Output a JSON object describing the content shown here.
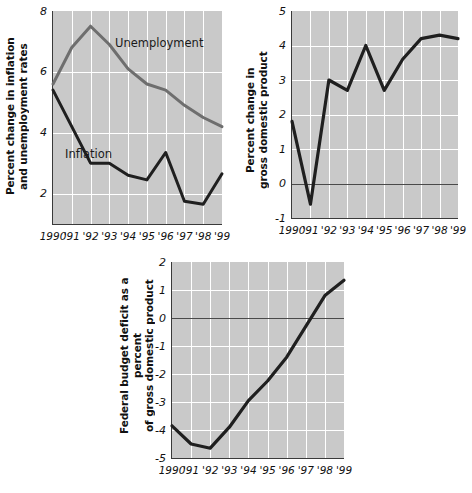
{
  "figure": {
    "panels": [
      "inflation-unemployment",
      "gdp",
      "deficit"
    ]
  },
  "chart_data": [
    {
      "id": "inflation-unemployment",
      "type": "line",
      "title": "",
      "xlabel": "",
      "ylabel": "Percent change in inflation\nand unemployment rates",
      "x": [
        1990,
        1991,
        1992,
        1993,
        1994,
        1995,
        1996,
        1997,
        1998,
        1999
      ],
      "xtick_labels": [
        "1990",
        "'91",
        "'92",
        "'93",
        "'94",
        "'95",
        "'96",
        "'97",
        "'98",
        "'99"
      ],
      "ytick_labels": [
        "8",
        "6",
        "4",
        "2"
      ],
      "yticks": [
        8,
        6,
        4,
        2
      ],
      "ylim": [
        1.0,
        8.0
      ],
      "grid": true,
      "legend": "inline-annotations",
      "series": [
        {
          "name": "Unemployment",
          "color": "#6e6e6e",
          "values": [
            5.6,
            6.8,
            7.5,
            6.9,
            6.1,
            5.6,
            5.4,
            4.9,
            4.5,
            4.2
          ],
          "annotation": "Unemployment"
        },
        {
          "name": "Inflation",
          "color": "#1f1f1f",
          "values": [
            5.4,
            4.2,
            3.0,
            3.0,
            2.6,
            2.45,
            3.35,
            1.75,
            1.65,
            2.65
          ],
          "annotation": "Inflation"
        }
      ]
    },
    {
      "id": "gdp",
      "type": "line",
      "title": "",
      "xlabel": "",
      "ylabel": "Percent change in\ngross domestic product",
      "x": [
        1990,
        1991,
        1992,
        1993,
        1994,
        1995,
        1996,
        1997,
        1998,
        1999
      ],
      "xtick_labels": [
        "1990",
        "'91",
        "'92",
        "'93",
        "'94",
        "'95",
        "'96",
        "'97",
        "'98",
        "'99"
      ],
      "ytick_labels": [
        "5",
        "4",
        "3",
        "2",
        "1",
        "0",
        "-1"
      ],
      "yticks": [
        5,
        4,
        3,
        2,
        1,
        0,
        -1
      ],
      "ylim": [
        -1,
        5
      ],
      "zero_line": 0,
      "grid": true,
      "series": [
        {
          "name": "Percent change in gross domestic product",
          "color": "#1f1f1f",
          "values": [
            1.8,
            -0.6,
            3.0,
            2.7,
            4.0,
            2.7,
            3.6,
            4.2,
            4.3,
            4.2
          ]
        }
      ]
    },
    {
      "id": "deficit",
      "type": "line",
      "title": "",
      "xlabel": "",
      "ylabel": "Federal budget deficit as a percent\nof gross domestic product",
      "x": [
        1990,
        1991,
        1992,
        1993,
        1994,
        1995,
        1996,
        1997,
        1998,
        1999
      ],
      "xtick_labels": [
        "1990",
        "'91",
        "'92",
        "'93",
        "'94",
        "'95",
        "'96",
        "'97",
        "'98",
        "'99"
      ],
      "ytick_labels": [
        "2",
        "1",
        "0",
        "-1",
        "-2",
        "-3",
        "-4",
        "-5"
      ],
      "yticks": [
        2,
        1,
        0,
        -1,
        -2,
        -3,
        -4,
        -5
      ],
      "ylim": [
        -5,
        2
      ],
      "zero_line": 0,
      "grid": true,
      "series": [
        {
          "name": "Federal budget deficit as a percent of gross domestic product",
          "color": "#1f1f1f",
          "values": [
            -3.85,
            -4.5,
            -4.65,
            -3.9,
            -2.95,
            -2.25,
            -1.4,
            -0.3,
            0.8,
            1.35
          ]
        }
      ]
    }
  ]
}
